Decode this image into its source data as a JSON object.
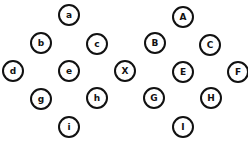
{
  "diagram": {
    "title": "",
    "groups": [
      {
        "name": "lowercase",
        "nodes": [
          "a",
          "b",
          "c",
          "d",
          "e",
          "g",
          "h",
          "i"
        ]
      },
      {
        "name": "center",
        "nodes": [
          "X"
        ]
      },
      {
        "name": "uppercase",
        "nodes": [
          "A",
          "B",
          "C",
          "E",
          "F",
          "G",
          "H",
          "I"
        ]
      }
    ],
    "nodes": {
      "a": "a",
      "b": "b",
      "c": "c",
      "d": "d",
      "e": "e",
      "g": "g",
      "h": "h",
      "i": "i",
      "X": "X",
      "A": "A",
      "B": "B",
      "C": "C",
      "E": "E",
      "F": "F",
      "G": "G",
      "H": "H",
      "I": "I"
    },
    "colors": {
      "stroke": "#111111",
      "background": "#ffffff"
    }
  }
}
